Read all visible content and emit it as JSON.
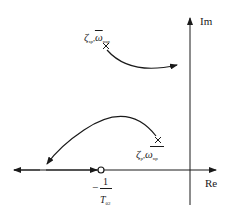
{
  "diagram": {
    "type": "root-locus",
    "axes": {
      "imag_label": "Im",
      "real_label": "Re"
    },
    "poles": [
      {
        "name": "short-period-pole",
        "marker": "cross",
        "label_zeta": "ζ",
        "label_zeta_sub": "sp",
        "separator": ",",
        "label_omega": "ω",
        "label_omega_sub": "nsp",
        "omega_overbar": true
      },
      {
        "name": "phugoid-pole",
        "marker": "cross",
        "label_zeta": "ζ",
        "label_zeta_sub": "p",
        "separator": ",",
        "label_omega": "ω",
        "label_omega_sub": "np",
        "omega_overbar": false
      }
    ],
    "zero": {
      "marker": "circle",
      "label_minus": "−",
      "label_numerator": "1",
      "label_denominator": "T",
      "label_denominator_sub": "θ2"
    }
  }
}
